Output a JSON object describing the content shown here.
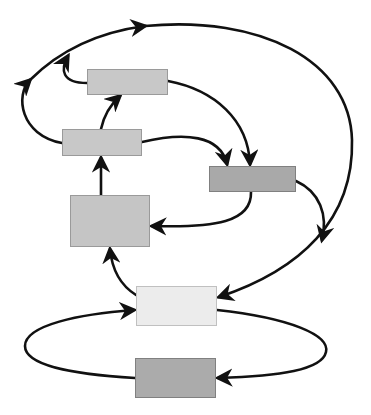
{
  "diagram": {
    "type": "flow-diagram",
    "nodes": [
      {
        "id": "A",
        "x": 87,
        "y": 69,
        "w": 81,
        "h": 26,
        "fill": "#c8c8c8"
      },
      {
        "id": "B",
        "x": 62,
        "y": 129,
        "w": 80,
        "h": 27,
        "fill": "#c8c8c8"
      },
      {
        "id": "C",
        "x": 209,
        "y": 166,
        "w": 87,
        "h": 26,
        "fill": "#a9a9a9"
      },
      {
        "id": "D",
        "x": 70,
        "y": 195,
        "w": 80,
        "h": 52,
        "fill": "#c5c5c5"
      },
      {
        "id": "E",
        "x": 136,
        "y": 286,
        "w": 81,
        "h": 40,
        "fill": "#ececec"
      },
      {
        "id": "F",
        "x": 135,
        "y": 358,
        "w": 81,
        "h": 40,
        "fill": "#ababab"
      }
    ],
    "edges": [
      {
        "from": "B",
        "to": "A"
      },
      {
        "from": "B",
        "to": "C"
      },
      {
        "from": "A",
        "to": "C"
      },
      {
        "from": "C",
        "to": "D"
      },
      {
        "from": "D",
        "to": "B"
      },
      {
        "from": "E",
        "to": "D"
      },
      {
        "from": "C",
        "to": "big-arc"
      },
      {
        "from": "A",
        "to": "top-arc"
      },
      {
        "from": "B",
        "to": "top-arc"
      },
      {
        "from": "top-arc",
        "to": "E"
      },
      {
        "from": "E",
        "to": "F",
        "via": "right-loop"
      },
      {
        "from": "F",
        "to": "E",
        "via": "left-loop"
      }
    ],
    "colors": {
      "stroke": "#111111",
      "background": "#ffffff"
    }
  }
}
